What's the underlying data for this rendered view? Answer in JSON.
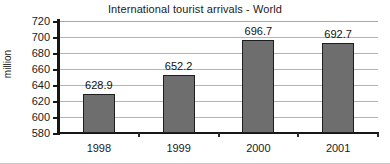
{
  "chart_data": {
    "type": "bar",
    "title": "International tourist arrivals - World",
    "xlabel": "",
    "ylabel": "million",
    "categories": [
      "1998",
      "1999",
      "2000",
      "2001"
    ],
    "values": [
      628.9,
      652.2,
      696.7,
      692.7
    ],
    "value_labels": [
      "628.9",
      "652.2",
      "696.7",
      "692.7"
    ],
    "ylim": [
      580,
      720
    ],
    "ytick_step": 20,
    "ytick_labels": [
      "720",
      "700",
      "680",
      "660",
      "640",
      "620",
      "600",
      "580"
    ],
    "ytick_values": [
      720,
      700,
      680,
      660,
      640,
      620,
      600,
      580
    ],
    "grid": true,
    "legend": false,
    "legend_position": "none",
    "series": [
      {
        "name": "International tourist arrivals",
        "values": [
          628.9,
          652.2,
          696.7,
          692.7
        ]
      }
    ],
    "colors": {
      "bar_fill": "#6e6e6e",
      "bar_border": "#1e1e1e",
      "gridline": "#b4b4b4",
      "axis": "#161616",
      "text": "#1a1a1a",
      "background": "#ffffff"
    }
  }
}
